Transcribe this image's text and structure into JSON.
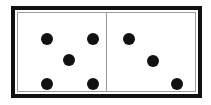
{
  "scene": {
    "title": "Domino tile",
    "background_color": "#ffffff"
  },
  "domino": {
    "name": "domino-tile",
    "value_text": "5 | 3",
    "total_pips": 8,
    "border_color": "#111111",
    "inner_line_color": "#9a9a9a",
    "face_color": "#ffffff",
    "pip_color": "#111111",
    "divider_color": "#9a9a9a",
    "bounds": {
      "x": 11,
      "y": 6,
      "width": 191,
      "height": 92
    },
    "faces": [
      {
        "name": "left-face",
        "pip_count": 5,
        "pattern": "quincunx",
        "pips": [
          {
            "name": "pip-top-left",
            "cx": 29,
            "cy": 26
          },
          {
            "name": "pip-top-right",
            "cx": 75,
            "cy": 26
          },
          {
            "name": "pip-center",
            "cx": 51,
            "cy": 47
          },
          {
            "name": "pip-bottom-left",
            "cx": 29,
            "cy": 71
          },
          {
            "name": "pip-bottom-right",
            "cx": 75,
            "cy": 71
          }
        ]
      },
      {
        "name": "right-face",
        "pip_count": 3,
        "pattern": "diagonal",
        "pips": [
          {
            "name": "pip-top-left",
            "cx": 22,
            "cy": 26
          },
          {
            "name": "pip-center",
            "cx": 46,
            "cy": 48
          },
          {
            "name": "pip-bottom-right",
            "cx": 70,
            "cy": 71
          }
        ]
      }
    ]
  }
}
